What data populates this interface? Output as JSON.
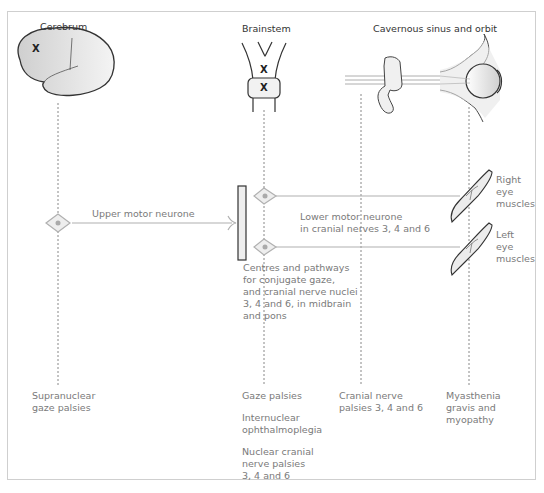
{
  "headers": {
    "cerebrum": "Cerebrum",
    "brainstem": "Brainstem",
    "cavernous": "Cavernous sinus and orbit"
  },
  "lesion_marks": {
    "cerebrum": "X",
    "brainstem_upper": "X",
    "brainstem_lower": "X"
  },
  "pathway_labels": {
    "upper_motor": "Upper motor neurone",
    "lower_motor_line1": "Lower motor neurone",
    "lower_motor_line2": "in cranial nerves 3, 4 and 6",
    "centres_line1": "Centres and pathways",
    "centres_line2": "for conjugate gaze,",
    "centres_line3": "and cranial nerve nuclei",
    "centres_line4": "3, 4 and 6, in midbrain",
    "centres_line5": "and pons",
    "right_eye_line1": "Right",
    "right_eye_line2": "eye",
    "right_eye_line3": "muscles",
    "left_eye_line1": "Left",
    "left_eye_line2": "eye",
    "left_eye_line3": "muscles"
  },
  "disorders": {
    "supranuclear_line1": "Supranuclear",
    "supranuclear_line2": "gaze palsies",
    "gaze_palsies": "Gaze palsies",
    "internuclear_line1": "Internuclear",
    "internuclear_line2": "ophthalmoplegia",
    "nuclear_line1": "Nuclear cranial",
    "nuclear_line2": "nerve palsies",
    "nuclear_line3": "3, 4 and 6",
    "cranial_line1": "Cranial nerve",
    "cranial_line2": "palsies 3, 4 and 6",
    "myasthenia_line1": "Myasthenia",
    "myasthenia_line2": "gravis and",
    "myasthenia_line3": "myopathy"
  },
  "colors": {
    "line": "#b0b0b0",
    "neuron": "#c9c9c9",
    "outline": "#333333",
    "text": "#7a7a7a"
  }
}
